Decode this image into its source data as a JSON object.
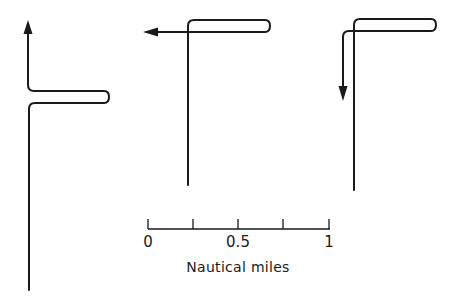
{
  "figure": {
    "type": "diagram",
    "maneuvers": [
      {
        "id": "maneuver-1",
        "direction": "resumes north (reciprocal return)",
        "arrow": "up"
      },
      {
        "id": "maneuver-2",
        "direction": "turns west",
        "arrow": "left"
      },
      {
        "id": "maneuver-3",
        "direction": "turns south (reciprocal course)",
        "arrow": "down"
      }
    ],
    "stroke_color": "#1a1a1a",
    "background_color": "#ffffff"
  },
  "scale_bar": {
    "tick_labels": [
      "0",
      "0.5",
      "1"
    ],
    "tick_count": 5,
    "unit_label": "Nautical miles",
    "range": [
      0,
      1
    ]
  }
}
